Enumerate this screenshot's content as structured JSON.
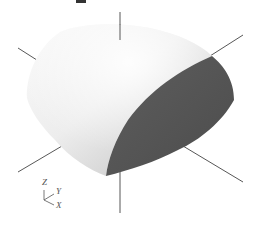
{
  "figure": {
    "colors": {
      "background": "#ffffff",
      "curved_surface_light": "#f2f2f2",
      "curved_surface_shadow": "#b8b8b8",
      "flat_face": "#555555",
      "axis_line": "#444444",
      "top_artifact": "#333333"
    }
  },
  "triad": {
    "z_label": "Z",
    "y_label": "Y",
    "x_label": "X"
  }
}
